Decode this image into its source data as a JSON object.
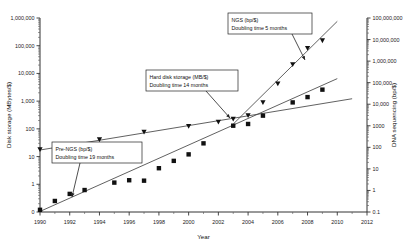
{
  "chart_data": {
    "type": "scatter",
    "title": "",
    "subtitle": "",
    "xlabel": "Year",
    "ylabel": "Disk storage (MBytes/$)",
    "y2label": "DNA sequencing (bp/$)",
    "xlim": [
      1990,
      2012
    ],
    "xticks": [
      "1990",
      "1992",
      "1994",
      "1996",
      "1998",
      "2000",
      "2002",
      "2004",
      "2006",
      "2008",
      "2010",
      "2012"
    ],
    "xtick_values": [
      1990,
      1992,
      1994,
      1996,
      1998,
      2000,
      2002,
      2004,
      2006,
      2008,
      2010,
      2012
    ],
    "ylim": [
      0.1,
      1000000
    ],
    "yscale": "log",
    "yticks": [
      "0",
      "1",
      "10",
      "100",
      "1,000",
      "10,000",
      "100,000",
      "1,000,000"
    ],
    "ytick_values": [
      0.1,
      1,
      10,
      100,
      1000,
      10000,
      100000,
      1000000
    ],
    "y2lim": [
      0.1,
      100000000
    ],
    "y2scale": "log",
    "y2ticks": [
      "0.1",
      "1",
      "10",
      "100",
      "1000",
      "10,000",
      "100,000",
      "1,000,000",
      "10,000,000",
      "100,000,000"
    ],
    "y2tick_values": [
      0.1,
      1,
      10,
      100,
      1000,
      10000,
      100000,
      1000000,
      10000000,
      100000000
    ],
    "grid": false,
    "legend": "none",
    "series": [
      {
        "name": "Hard disk storage (MB/$)",
        "marker": "square",
        "axis": "left",
        "color": "#111111",
        "points": [
          {
            "x": 1990,
            "y": 0.12
          },
          {
            "x": 1991,
            "y": 0.25
          },
          {
            "x": 1992,
            "y": 0.45
          },
          {
            "x": 1993,
            "y": 0.62
          },
          {
            "x": 1995,
            "y": 1.15
          },
          {
            "x": 1996,
            "y": 1.4
          },
          {
            "x": 1997,
            "y": 1.35
          },
          {
            "x": 1998,
            "y": 3.8
          },
          {
            "x": 1999,
            "y": 7.0
          },
          {
            "x": 2000,
            "y": 12.0
          },
          {
            "x": 2001,
            "y": 30.0
          },
          {
            "x": 2003,
            "y": 130.0
          },
          {
            "x": 2004,
            "y": 150.0
          },
          {
            "x": 2005,
            "y": 300.0
          },
          {
            "x": 2007,
            "y": 900.0
          },
          {
            "x": 2008,
            "y": 1400.0
          },
          {
            "x": 2009,
            "y": 2600.0
          }
        ]
      },
      {
        "name": "DNA sequencing (bp/$)",
        "marker": "triangle",
        "axis": "right",
        "color": "#111111",
        "points": [
          {
            "x": 1990,
            "y": 80.0
          },
          {
            "x": 1994,
            "y": 230.0
          },
          {
            "x": 1997,
            "y": 520.0
          },
          {
            "x": 2000,
            "y": 950.0
          },
          {
            "x": 2002,
            "y": 1500.0
          },
          {
            "x": 2003,
            "y": 2100.0
          },
          {
            "x": 2004,
            "y": 3000.0
          },
          {
            "x": 2005,
            "y": 12000.0
          },
          {
            "x": 2006,
            "y": 90000.0
          },
          {
            "x": 2007,
            "y": 700000.0
          },
          {
            "x": 2008,
            "y": 4000000.0
          },
          {
            "x": 2009,
            "y": 9000000.0
          }
        ]
      }
    ],
    "trendlines": [
      {
        "name": "Hard disk storage trend",
        "axis": "left",
        "x0": 1990,
        "y0": 0.105,
        "x1": 2010,
        "y1": 6500.0
      },
      {
        "name": "Pre-NGS trend",
        "axis": "right",
        "x0": 1990,
        "y0": 75.0,
        "x1": 2011,
        "y1": 18000.0
      },
      {
        "name": "NGS trend",
        "axis": "right",
        "x0": 2003,
        "y0": 1200.0,
        "x1": 2010,
        "y1": 70000000.0
      }
    ],
    "annotations": [
      {
        "id": "ngs",
        "line1": "NGS (bp/$)",
        "line2": "Doubling time 5 months",
        "box": {
          "x": 228,
          "y": 13,
          "w": 84,
          "h": 21
        },
        "arrow": {
          "x1": 292,
          "y1": 34,
          "x2": 305,
          "y2": 60
        }
      },
      {
        "id": "hard-disk",
        "line1": "Hard disk storage (MB/$)",
        "line2": "Doubling time 14 months",
        "box": {
          "x": 146,
          "y": 70,
          "w": 92,
          "h": 21
        },
        "arrow": {
          "x1": 206,
          "y1": 91,
          "x2": 230,
          "y2": 118
        }
      },
      {
        "id": "pre-ngs",
        "line1": "Pre-NGS (bp/$)",
        "line2": "Doubling time 19 months",
        "box": {
          "x": 52,
          "y": 142,
          "w": 90,
          "h": 21
        },
        "arrow": {
          "x1": 80,
          "y1": 163,
          "x2": 72,
          "y2": 197
        }
      }
    ]
  }
}
